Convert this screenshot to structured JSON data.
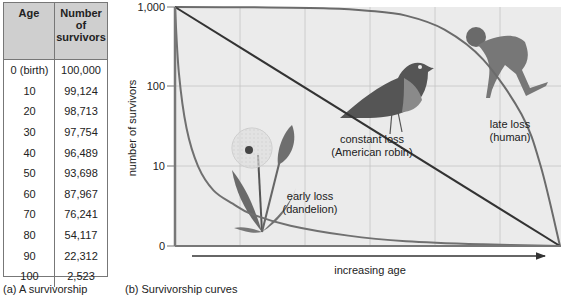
{
  "table": {
    "headers": [
      "Age",
      "Number of survivors"
    ],
    "header_lines": [
      [
        "Age"
      ],
      [
        "Number",
        "of",
        "survivors"
      ]
    ],
    "rows": [
      [
        "0 (birth)",
        "100,000"
      ],
      [
        "10",
        "99,124"
      ],
      [
        "20",
        "98,713"
      ],
      [
        "30",
        "97,754"
      ],
      [
        "40",
        "96,489"
      ],
      [
        "50",
        "93,698"
      ],
      [
        "60",
        "87,967"
      ],
      [
        "70",
        "76,241"
      ],
      [
        "80",
        "54,117"
      ],
      [
        "90",
        "22,312"
      ],
      [
        "100",
        "2,523"
      ]
    ],
    "caption": "(a) A survivorship"
  },
  "chart_caption": "(b) Survivorship curves",
  "chart_data": {
    "type": "line",
    "title": "Survivorship curves",
    "xlabel": "increasing age",
    "ylabel": "number of survivors",
    "yscale": "log",
    "yticks": [
      "1,000",
      "100",
      "10",
      "0"
    ],
    "ylim": [
      1,
      1000
    ],
    "xlim": [
      0,
      1
    ],
    "grid": true,
    "series": [
      {
        "name": "late loss (human)",
        "label_lines": [
          "late loss",
          "(human)"
        ],
        "style": "convex",
        "x": [
          0,
          0.2,
          0.4,
          0.5,
          0.6,
          0.7,
          0.8,
          0.9,
          0.95,
          1.0
        ],
        "y": [
          1000,
          990,
          960,
          900,
          780,
          520,
          220,
          45,
          10,
          1
        ]
      },
      {
        "name": "constant loss (American robin)",
        "label_lines": [
          "constant loss",
          "(American robin)"
        ],
        "style": "linear",
        "x": [
          0,
          1.0
        ],
        "y": [
          1000,
          1
        ]
      },
      {
        "name": "early loss (dandelion)",
        "label_lines": [
          "early loss",
          "(dandelion)"
        ],
        "style": "concave",
        "x": [
          0,
          0.01,
          0.03,
          0.06,
          0.1,
          0.15,
          0.2,
          0.3,
          0.45,
          0.6,
          0.8,
          1.0
        ],
        "y": [
          1000,
          150,
          30,
          10,
          5,
          3.4,
          2.5,
          1.8,
          1.35,
          1.15,
          1.05,
          1
        ]
      }
    ],
    "illustrations": [
      "human-figure",
      "robin-bird",
      "dandelion-plant"
    ]
  }
}
